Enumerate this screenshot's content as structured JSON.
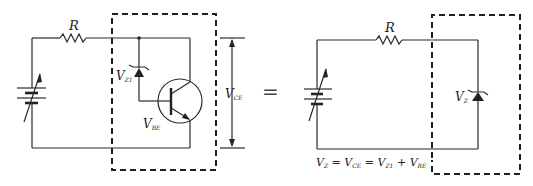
{
  "diagram": {
    "type": "circuit-equivalence",
    "left_circuit": {
      "resistor_label": "R",
      "zener_label_main": "V",
      "zener_label_sub": "Z1",
      "vbe_label_main": "V",
      "vbe_label_sub": "BE",
      "vce_label_main": "V",
      "vce_label_sub": "CE",
      "components": [
        "variable-dc-source",
        "resistor",
        "zener-diode",
        "npn-transistor"
      ]
    },
    "equals_sign": "=",
    "right_circuit": {
      "resistor_label": "R",
      "zener_label_main": "V",
      "zener_label_sub": "Z",
      "components": [
        "variable-dc-source",
        "resistor",
        "zener-diode"
      ]
    },
    "equation": {
      "p1": "V",
      "p1_sub": "Z",
      "p2": " = V",
      "p2_sub": "CE",
      "p3": " = V",
      "p3_sub": "Z1",
      "p4": " + V",
      "p4_sub": "BE"
    },
    "colors": {
      "ink": "#222222",
      "background": "#ffffff"
    }
  }
}
